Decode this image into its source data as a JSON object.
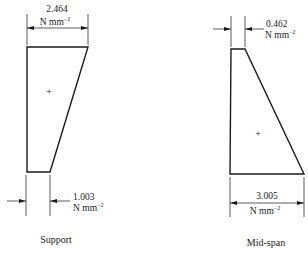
{
  "diagrams": [
    {
      "name": "support",
      "caption": "Support",
      "top_stress": {
        "value": "2.464",
        "unit": "N mm",
        "exp": "−2"
      },
      "bottom_stress": {
        "value": "1.003",
        "unit": "N mm",
        "exp": "−2"
      },
      "centroid_marker": "+"
    },
    {
      "name": "mid-span",
      "caption": "Mid-span",
      "top_stress": {
        "value": "0.462",
        "unit": "N mm",
        "exp": "−2"
      },
      "bottom_stress": {
        "value": "3.005",
        "unit": "N mm",
        "exp": "−2"
      },
      "centroid_marker": "+"
    }
  ]
}
